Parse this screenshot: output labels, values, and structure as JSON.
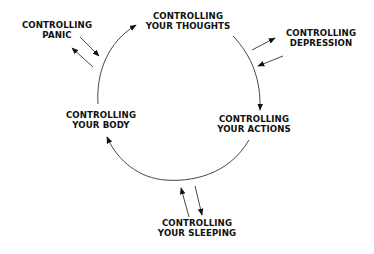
{
  "diagram": {
    "type": "cycle",
    "nodes": [
      {
        "id": "thoughts",
        "line1": "CONTROLLING",
        "line2": "YOUR THOUGHTS",
        "position": "top"
      },
      {
        "id": "actions",
        "line1": "CONTROLLING",
        "line2": "YOUR ACTIONS",
        "position": "right"
      },
      {
        "id": "body",
        "line1": "CONTROLLING",
        "line2": "YOUR BODY",
        "position": "left"
      }
    ],
    "satellites": [
      {
        "id": "panic",
        "line1": "CONTROLLING",
        "line2": "PANIC",
        "linked_to": "cycle-left-arc",
        "arrows": "bidirectional"
      },
      {
        "id": "depression",
        "line1": "CONTROLLING",
        "line2": "DEPRESSION",
        "linked_to": "cycle-right-arc",
        "arrows": "bidirectional"
      },
      {
        "id": "sleeping",
        "line1": "CONTROLLING",
        "line2": "YOUR SLEEPING",
        "linked_to": "cycle-bottom-arc",
        "arrows": "bidirectional"
      }
    ],
    "cycle_edges": [
      {
        "from": "body",
        "to": "thoughts"
      },
      {
        "from": "thoughts",
        "to": "actions"
      },
      {
        "from": "actions",
        "to": "body"
      }
    ],
    "colors": {
      "text": "#111111",
      "line": "#333333",
      "background": "#ffffff"
    }
  }
}
